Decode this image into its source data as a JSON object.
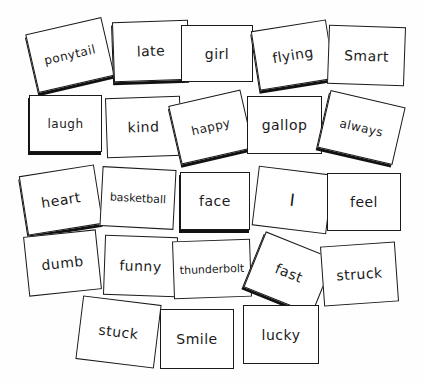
{
  "board": {
    "cards": [
      {
        "word": "ponytail",
        "x": 31,
        "y": 25,
        "w": 78,
        "h": 60,
        "rot": -13,
        "shadow": true,
        "size": "mid"
      },
      {
        "word": "late",
        "x": 113,
        "y": 21,
        "w": 76,
        "h": 60,
        "rot": -2,
        "shadow": true,
        "size": ""
      },
      {
        "word": "girl",
        "x": 181,
        "y": 25,
        "w": 72,
        "h": 57,
        "rot": 0,
        "shadow": false,
        "size": ""
      },
      {
        "word": "flying",
        "x": 255,
        "y": 25,
        "w": 76,
        "h": 60,
        "rot": -9,
        "shadow": true,
        "size": ""
      },
      {
        "word": "Smart",
        "x": 328,
        "y": 26,
        "w": 77,
        "h": 59,
        "rot": 2,
        "shadow": false,
        "size": ""
      },
      {
        "word": "laugh",
        "x": 29,
        "y": 95,
        "w": 73,
        "h": 57,
        "rot": 0,
        "shadow": true,
        "size": "mid"
      },
      {
        "word": "kind",
        "x": 106,
        "y": 97,
        "w": 75,
        "h": 60,
        "rot": -2,
        "shadow": false,
        "size": ""
      },
      {
        "word": "happy",
        "x": 174,
        "y": 97,
        "w": 74,
        "h": 60,
        "rot": -13,
        "shadow": true,
        "size": "mid"
      },
      {
        "word": "gallop",
        "x": 247,
        "y": 96,
        "w": 75,
        "h": 58,
        "rot": 0,
        "shadow": false,
        "size": ""
      },
      {
        "word": "always",
        "x": 323,
        "y": 98,
        "w": 77,
        "h": 59,
        "rot": 13,
        "shadow": true,
        "size": "mid"
      },
      {
        "word": "heart",
        "x": 23,
        "y": 170,
        "w": 76,
        "h": 60,
        "rot": -9,
        "shadow": true,
        "size": ""
      },
      {
        "word": "basketball",
        "x": 101,
        "y": 168,
        "w": 74,
        "h": 60,
        "rot": 3,
        "shadow": false,
        "size": "small"
      },
      {
        "word": "face",
        "x": 180,
        "y": 172,
        "w": 70,
        "h": 58,
        "rot": 0,
        "shadow": true,
        "size": ""
      },
      {
        "word": "I",
        "x": 255,
        "y": 170,
        "w": 75,
        "h": 60,
        "rot": 7,
        "shadow": false,
        "size": "big"
      },
      {
        "word": "feel",
        "x": 327,
        "y": 173,
        "w": 74,
        "h": 58,
        "rot": 0,
        "shadow": false,
        "size": ""
      },
      {
        "word": "dumb",
        "x": 26,
        "y": 233,
        "w": 73,
        "h": 60,
        "rot": -6,
        "shadow": false,
        "size": ""
      },
      {
        "word": "funny",
        "x": 104,
        "y": 236,
        "w": 73,
        "h": 60,
        "rot": 2,
        "shadow": false,
        "size": ""
      },
      {
        "word": "thunderbolt",
        "x": 173,
        "y": 240,
        "w": 78,
        "h": 58,
        "rot": -2,
        "shadow": false,
        "size": "small"
      },
      {
        "word": "fast",
        "x": 252,
        "y": 243,
        "w": 74,
        "h": 60,
        "rot": 22,
        "shadow": true,
        "size": ""
      },
      {
        "word": "struck",
        "x": 322,
        "y": 244,
        "w": 75,
        "h": 60,
        "rot": -4,
        "shadow": false,
        "size": ""
      },
      {
        "word": "stuck",
        "x": 79,
        "y": 300,
        "w": 79,
        "h": 64,
        "rot": 7,
        "shadow": false,
        "size": ""
      },
      {
        "word": "Smile",
        "x": 160,
        "y": 309,
        "w": 74,
        "h": 60,
        "rot": 0,
        "shadow": false,
        "size": ""
      },
      {
        "word": "lucky",
        "x": 243,
        "y": 305,
        "w": 76,
        "h": 59,
        "rot": 0,
        "shadow": false,
        "size": ""
      }
    ]
  }
}
